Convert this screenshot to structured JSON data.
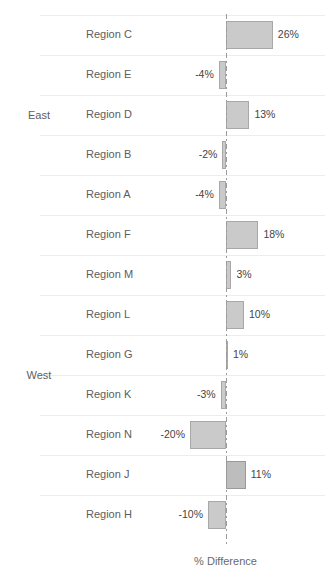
{
  "chart_data": {
    "type": "bar",
    "orientation": "horizontal",
    "title": "",
    "xlabel": "% Difference",
    "ylabel": "",
    "xlim": [
      -22,
      28
    ],
    "zero_line": 0,
    "grid": true,
    "legend": false,
    "value_suffix": "%",
    "groups": [
      {
        "name": "East",
        "categories": [
          "Region C",
          "Region E",
          "Region D",
          "Region B",
          "Region A"
        ],
        "values": [
          26,
          -4,
          13,
          -2,
          -4
        ],
        "labels": [
          "26%",
          "-4%",
          "13%",
          "-2%",
          "-4%"
        ]
      },
      {
        "name": "West",
        "categories": [
          "Region F",
          "Region M",
          "Region L",
          "Region G",
          "Region K",
          "Region N",
          "Region J",
          "Region H"
        ],
        "values": [
          18,
          3,
          10,
          1,
          -3,
          -20,
          11,
          -10
        ],
        "labels": [
          "18%",
          "3%",
          "10%",
          "1%",
          "-3%",
          "-20%",
          "11%",
          "-10%"
        ]
      }
    ],
    "categories": [
      "Region C",
      "Region E",
      "Region D",
      "Region B",
      "Region A",
      "Region F",
      "Region M",
      "Region L",
      "Region G",
      "Region K",
      "Region N",
      "Region J",
      "Region H"
    ],
    "values": [
      26,
      -4,
      13,
      -2,
      -4,
      18,
      3,
      10,
      1,
      -3,
      -20,
      11,
      -10
    ],
    "colors": {
      "bar_fill": "#cacaca",
      "bar_stroke": "#a8a8a8",
      "bar_fill_dark": "#bdbdbd",
      "gridline": "#ededed",
      "axis_line": "#9b9b9b",
      "text": "#5d5d5d",
      "background": "#ffffff"
    }
  },
  "axis": {
    "title": "% Difference"
  },
  "rows": [
    {
      "group": "East",
      "group_first": true,
      "category": "Region C",
      "value": 26,
      "label": "26%"
    },
    {
      "group": "East",
      "group_first": false,
      "category": "Region E",
      "value": -4,
      "label": "-4%"
    },
    {
      "group": "East",
      "group_first": false,
      "category": "Region D",
      "value": 13,
      "label": "13%"
    },
    {
      "group": "East",
      "group_first": false,
      "category": "Region B",
      "value": -2,
      "label": "-2%"
    },
    {
      "group": "East",
      "group_first": false,
      "category": "Region A",
      "value": -4,
      "label": "-4%"
    },
    {
      "group": "West",
      "group_first": true,
      "category": "Region F",
      "value": 18,
      "label": "18%"
    },
    {
      "group": "West",
      "group_first": false,
      "category": "Region M",
      "value": 3,
      "label": "3%"
    },
    {
      "group": "West",
      "group_first": false,
      "category": "Region L",
      "value": 10,
      "label": "10%"
    },
    {
      "group": "West",
      "group_first": false,
      "category": "Region G",
      "value": 1,
      "label": "1%"
    },
    {
      "group": "West",
      "group_first": false,
      "category": "Region K",
      "value": -3,
      "label": "-3%"
    },
    {
      "group": "West",
      "group_first": false,
      "category": "Region N",
      "value": -20,
      "label": "-20%"
    },
    {
      "group": "West",
      "group_first": false,
      "category": "Region J",
      "value": 11,
      "label": "11%"
    },
    {
      "group": "West",
      "group_first": false,
      "category": "Region H",
      "value": -10,
      "label": "-10%"
    }
  ],
  "group_labels": [
    {
      "name": "East",
      "text": "East"
    },
    {
      "name": "West",
      "text": "West"
    }
  ]
}
